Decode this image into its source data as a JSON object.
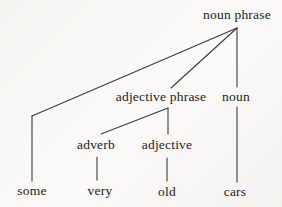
{
  "figure": {
    "type": "syntax-tree-diagram",
    "background_color": "#faf9f6",
    "line_color": "#3d3c3a",
    "text_color": "#1e1d1b"
  },
  "tree": {
    "root_label": "noun phrase",
    "sentence": "some very old cars",
    "nodes": [
      {
        "id": "noun-phrase",
        "label": "noun phrase",
        "x": 237,
        "y": 15
      },
      {
        "id": "adjective-phrase",
        "label": "adjective phrase",
        "x": 161,
        "y": 97
      },
      {
        "id": "noun",
        "label": "noun",
        "x": 236,
        "y": 97
      },
      {
        "id": "adverb",
        "label": "adverb",
        "x": 96,
        "y": 145
      },
      {
        "id": "adjective",
        "label": "adjective",
        "x": 167,
        "y": 145
      },
      {
        "id": "some",
        "label": "some",
        "x": 32,
        "y": 191
      },
      {
        "id": "very",
        "label": "very",
        "x": 100,
        "y": 191
      },
      {
        "id": "old",
        "label": "old",
        "x": 167,
        "y": 192
      },
      {
        "id": "cars",
        "label": "cars",
        "x": 235,
        "y": 192
      }
    ],
    "edges": [
      {
        "name": "noun-phrase-to-some-diagonal",
        "x1": 237,
        "y1": 28,
        "x2": 32,
        "y2": 116
      },
      {
        "name": "some-branch-vertical",
        "x1": 32,
        "y1": 116,
        "x2": 32,
        "y2": 181
      },
      {
        "name": "noun-phrase-to-adjective-phrase",
        "x1": 237,
        "y1": 28,
        "x2": 171,
        "y2": 88
      },
      {
        "name": "noun-phrase-to-noun",
        "x1": 237,
        "y1": 28,
        "x2": 237,
        "y2": 87
      },
      {
        "name": "adjective-phrase-to-adverb",
        "x1": 168,
        "y1": 108,
        "x2": 101,
        "y2": 134
      },
      {
        "name": "adjective-phrase-to-adjective",
        "x1": 168,
        "y1": 108,
        "x2": 168,
        "y2": 134
      },
      {
        "name": "adverb-to-very",
        "x1": 97,
        "y1": 157,
        "x2": 97,
        "y2": 180
      },
      {
        "name": "adjective-to-old",
        "x1": 167,
        "y1": 158,
        "x2": 167,
        "y2": 181
      },
      {
        "name": "noun-to-cars",
        "x1": 237,
        "y1": 107,
        "x2": 237,
        "y2": 182
      }
    ]
  }
}
